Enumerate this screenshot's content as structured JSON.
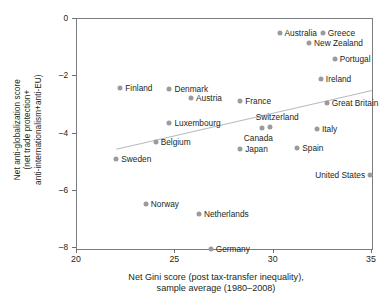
{
  "chart_data": {
    "type": "scatter",
    "title": "",
    "xlabel_lines": [
      "Net Gini score (post tax-transfer inequality),",
      "sample average (1980–2008)"
    ],
    "ylabel_lines": [
      "Net anti-globalization score",
      "(net trade protection+",
      "anti-internationalism+anti-EU)"
    ],
    "xlim": [
      20,
      35
    ],
    "ylim": [
      -8.4,
      0.35
    ],
    "xticks": [
      20,
      25,
      30,
      35
    ],
    "xtick_labels": [
      "20",
      "25",
      "30",
      "35"
    ],
    "yticks": [
      0,
      -2,
      -4,
      -6,
      -8
    ],
    "ytick_labels": [
      "0",
      "–2",
      "–4",
      "–6",
      "–8"
    ],
    "grid": false,
    "legend": "none",
    "marker_color": "#9a9b9f",
    "trendline": {
      "show": true,
      "color": "#b9babd",
      "x0": 22.0,
      "y0": -4.55,
      "x1": 35.0,
      "y1": -2.5
    },
    "points": [
      {
        "label": "Australia",
        "x": 30.3,
        "y": -0.5,
        "label_side": "right"
      },
      {
        "label": "Greece",
        "x": 32.5,
        "y": -0.5,
        "label_side": "right"
      },
      {
        "label": "New Zealand",
        "x": 31.8,
        "y": -0.85,
        "label_side": "right"
      },
      {
        "label": "Portugal",
        "x": 33.1,
        "y": -1.4,
        "label_side": "right"
      },
      {
        "label": "Ireland",
        "x": 32.4,
        "y": -2.1,
        "label_side": "right"
      },
      {
        "label": "Finland",
        "x": 22.2,
        "y": -2.4,
        "label_side": "right"
      },
      {
        "label": "Denmark",
        "x": 24.7,
        "y": -2.45,
        "label_side": "right"
      },
      {
        "label": "Austria",
        "x": 25.8,
        "y": -2.75,
        "label_side": "right"
      },
      {
        "label": "France",
        "x": 28.3,
        "y": -2.85,
        "label_side": "right"
      },
      {
        "label": "Great Britain",
        "x": 32.7,
        "y": -2.95,
        "label_side": "right"
      },
      {
        "label": "Luxembourg",
        "x": 24.7,
        "y": -3.65,
        "label_side": "right"
      },
      {
        "label": "Switzerland",
        "x": 29.8,
        "y": -3.78,
        "label_side": "above"
      },
      {
        "label": "Canada",
        "x": 29.4,
        "y": -3.8,
        "label_side": "below"
      },
      {
        "label": "Italy",
        "x": 32.2,
        "y": -3.85,
        "label_side": "right"
      },
      {
        "label": "Belgium",
        "x": 24.0,
        "y": -4.3,
        "label_side": "right"
      },
      {
        "label": "Spain",
        "x": 31.2,
        "y": -4.5,
        "label_side": "right"
      },
      {
        "label": "Japan",
        "x": 28.3,
        "y": -4.55,
        "label_side": "right"
      },
      {
        "label": "Sweden",
        "x": 22.0,
        "y": -4.9,
        "label_side": "right"
      },
      {
        "label": "United States",
        "x": 34.9,
        "y": -5.45,
        "label_side": "left"
      },
      {
        "label": "Norway",
        "x": 23.5,
        "y": -6.45,
        "label_side": "right"
      },
      {
        "label": "Netherlands",
        "x": 26.2,
        "y": -6.8,
        "label_side": "right"
      },
      {
        "label": "Germany",
        "x": 26.8,
        "y": -8.05,
        "label_side": "right"
      }
    ]
  }
}
